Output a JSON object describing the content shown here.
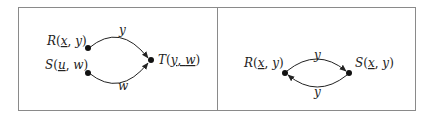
{
  "panels": [
    {
      "id": "left",
      "nodes": [
        {
          "id": "R",
          "name": "R",
          "args": [
            {
              "v": "x",
              "underline": true
            },
            {
              "v": "y",
              "underline": false
            }
          ]
        },
        {
          "id": "S",
          "name": "S",
          "args": [
            {
              "v": "u",
              "underline": true
            },
            {
              "v": "w",
              "underline": false
            }
          ]
        },
        {
          "id": "T",
          "name": "T",
          "args": [
            {
              "v": "y",
              "underline": true
            },
            {
              "v": "w",
              "underline": true
            }
          ]
        }
      ],
      "edges": [
        {
          "from": "R",
          "to": "T",
          "label": "y"
        },
        {
          "from": "S",
          "to": "T",
          "label": "w"
        }
      ],
      "text": {
        "R_name": "R",
        "R_arg1": "x",
        "R_arg2": "y",
        "S_name": "S",
        "S_arg1": "u",
        "S_arg2": "w",
        "T_name": "T",
        "T_arg1": "y",
        "T_arg2": "w",
        "edge_RT": "y",
        "edge_ST": "w"
      }
    },
    {
      "id": "right",
      "nodes": [
        {
          "id": "R",
          "name": "R",
          "args": [
            {
              "v": "x",
              "underline": true
            },
            {
              "v": "y",
              "underline": false
            }
          ]
        },
        {
          "id": "S",
          "name": "S",
          "args": [
            {
              "v": "x",
              "underline": true
            },
            {
              "v": "y",
              "underline": false
            }
          ]
        }
      ],
      "edges": [
        {
          "from": "R",
          "to": "S",
          "label": "y"
        },
        {
          "from": "S",
          "to": "R",
          "label": "y"
        }
      ],
      "text": {
        "R_name": "R",
        "R_arg1": "x",
        "R_arg2": "y",
        "S_name": "S",
        "S_arg1": "x",
        "S_arg2": "y",
        "edge_RS": "y",
        "edge_SR": "y"
      }
    }
  ],
  "colors": {
    "border": "#8a8a8a",
    "stroke": "#222222",
    "node": "#111111"
  }
}
